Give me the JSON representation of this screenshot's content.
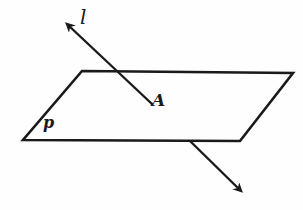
{
  "diagram": {
    "labels": {
      "line": "l",
      "point": "A",
      "plane": "p"
    },
    "colors": {
      "stroke": "#1a1a1a",
      "background": "#fefefe"
    },
    "plane": {
      "points": "82,71 293,73 240,141 23,140"
    },
    "line_upper": {
      "x1": 152,
      "y1": 104,
      "x2": 67,
      "y2": 24
    },
    "line_lower": {
      "x1": 190,
      "y1": 141,
      "x2": 240,
      "y2": 190
    }
  }
}
